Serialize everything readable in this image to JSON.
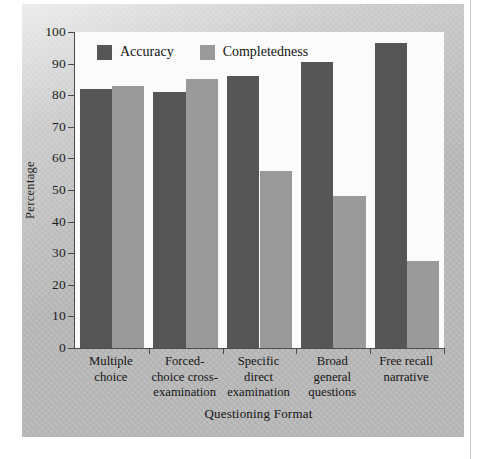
{
  "chart_data": {
    "type": "bar",
    "title": "",
    "xlabel": "Questioning Format",
    "ylabel": "Percentage",
    "ylim": [
      0,
      100
    ],
    "ytick_labels": [
      "100",
      "90",
      "80",
      "70",
      "60",
      "50",
      "40",
      "30",
      "20",
      "10",
      "0"
    ],
    "ytick_values": [
      100,
      90,
      80,
      70,
      60,
      50,
      40,
      30,
      20,
      10,
      0
    ],
    "grid": false,
    "legend_position": "top-left inside plot",
    "categories": [
      "Multiple choice",
      "Forced-choice cross-examination",
      "Specific direct examination",
      "Broad general questions",
      "Free recall narrative"
    ],
    "category_label_lines": [
      [
        "Multiple",
        "choice"
      ],
      [
        "Forced-",
        "choice cross-",
        "examination"
      ],
      [
        "Specific",
        "direct",
        "examination"
      ],
      [
        "Broad",
        "general",
        "questions"
      ],
      [
        "Free recall",
        "narrative"
      ]
    ],
    "series": [
      {
        "name": "Accuracy",
        "color": "#565656",
        "values": [
          82,
          81,
          86,
          90.5,
          96.5
        ]
      },
      {
        "name": "Completedness",
        "color": "#9a9a9a",
        "values": [
          83,
          85,
          56,
          48,
          27.5
        ]
      }
    ]
  },
  "legend": {
    "items": [
      {
        "label": "Accuracy",
        "color": "#565656"
      },
      {
        "label": "Completedness",
        "color": "#9a9a9a"
      }
    ]
  },
  "axes": {
    "y_title": "Percentage",
    "x_title": "Questioning Format"
  },
  "colors": {
    "accuracy": "#565656",
    "completedness": "#9a9a9a",
    "panel_background": "#b9b9b9",
    "plot_background": "#fbfbfb",
    "axis_line": "#4a4a4a"
  }
}
